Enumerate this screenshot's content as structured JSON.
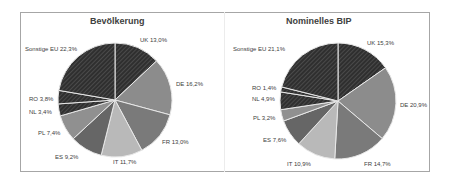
{
  "chart_data": [
    {
      "type": "pie",
      "title": "Bevölkerung",
      "categories": [
        "UK",
        "DE",
        "FR",
        "IT",
        "ES",
        "PL",
        "NL",
        "RO",
        "Sonstige EU"
      ],
      "values": [
        13.0,
        16.2,
        13.0,
        11.7,
        9.2,
        7.4,
        3.4,
        3.8,
        22.3
      ],
      "labels": [
        "UK 13,0%",
        "DE 16,2%",
        "FR 13,0%",
        "IT 11,7%",
        "ES 9,2%",
        "PL 7,4%",
        "NL 3,4%",
        "RO 3,8%",
        "Sonstige EU 22,3%"
      ],
      "unit": "%",
      "legend": "none (data labels)"
    },
    {
      "type": "pie",
      "title": "Nominelles BIP",
      "categories": [
        "UK",
        "DE",
        "FR",
        "IT",
        "ES",
        "PL",
        "NL",
        "RO",
        "Sonstige EU"
      ],
      "values": [
        15.3,
        20.9,
        14.7,
        10.9,
        7.6,
        3.2,
        4.9,
        1.4,
        21.1
      ],
      "labels": [
        "UK 15,3%",
        "DE 20,9%",
        "FR 14,7%",
        "IT 10,9%",
        "ES 7,6%",
        "PL 3,2%",
        "NL 4,9%",
        "RO 1,4%",
        "Sonstige EU 21,1%"
      ],
      "unit": "%",
      "legend": "none (data labels)"
    }
  ],
  "charts": [
    {
      "title": "Bevölkerung",
      "labels": {
        "uk": "UK 13,0%",
        "de": "DE 16,2%",
        "fr": "FR 13,0%",
        "it": "IT 11,7%",
        "es": "ES 9,2%",
        "pl": "PL 7,4%",
        "nl": "NL 3,4%",
        "ro": "RO 3,8%",
        "other": "Sonstige EU 22,3%"
      }
    },
    {
      "title": "Nominelles BIP",
      "labels": {
        "uk": "UK 15,3%",
        "de": "DE 20,9%",
        "fr": "FR 14,7%",
        "it": "IT 10,9%",
        "es": "ES 7,6%",
        "pl": "PL 3,2%",
        "nl": "NL 4,9%",
        "ro": "RO 1,4%",
        "other": "Sonstige EU 21,1%"
      }
    }
  ],
  "colors": {
    "UK": "#3a3a3a",
    "DE": "#8c8c8c",
    "FR": "#7a7a7a",
    "IT": "#b9b9b9",
    "ES": "#666666",
    "PL": "#909090",
    "NL": "#2e2e2e",
    "RO": "#333333",
    "Sonstige EU": "#3c3c3c",
    "separator": "#e8e8e8"
  }
}
